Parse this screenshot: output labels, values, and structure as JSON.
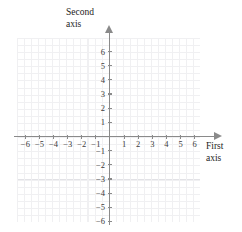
{
  "chart_data": {
    "type": "scatter",
    "title": "",
    "xlabel": "First axis",
    "ylabel": "Second axis",
    "xlim": [
      -6.8,
      6.4
    ],
    "ylim": [
      -6.5,
      6.7
    ],
    "x_ticks": [
      -6,
      -5,
      -4,
      -3,
      -2,
      -1,
      1,
      2,
      3,
      4,
      5,
      6
    ],
    "y_ticks": [
      6,
      5,
      4,
      3,
      2,
      1,
      -1,
      -2,
      -3,
      -4,
      -5,
      -6
    ],
    "x_tick_labels": [
      "−6",
      "−5",
      "−4",
      "−3",
      "−2",
      "−1",
      "1",
      "2",
      "3",
      "4",
      "5",
      "6"
    ],
    "y_tick_labels": [
      "6",
      "5",
      "4",
      "3",
      "2",
      "1",
      "−1",
      "−2",
      "−3",
      "−4",
      "−5",
      "−6"
    ],
    "origin_label": "",
    "grid": true,
    "minor_grid": true,
    "minor_grid_divisions": 2,
    "legend": null,
    "series": [],
    "annotations": [],
    "axis_arrows": [
      "up",
      "right"
    ]
  },
  "axes": {
    "vertical_name_line1": "Second",
    "vertical_name_line2": "axis",
    "horizontal_name_line1": "First",
    "horizontal_name_line2": "axis"
  },
  "colors": {
    "axis": "#8a8a8a",
    "major_grid": "#e2e2e6",
    "minor_grid": "#f0f0f2",
    "label_text": "#3b3b3b",
    "axis_name_text": "#1d1d1d",
    "background": "#ffffff"
  }
}
